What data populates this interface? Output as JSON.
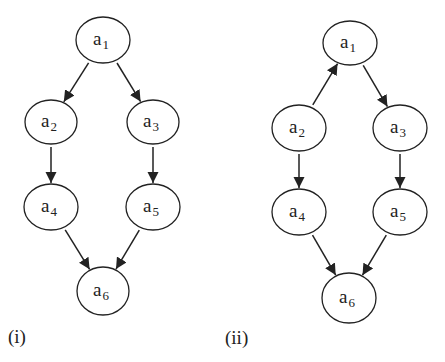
{
  "panels": [
    {
      "id": "i",
      "label": "(i)",
      "label_pos": {
        "x": 8,
        "y": 327
      },
      "nodes": [
        {
          "id": "a1",
          "base": "a",
          "sub": "1",
          "cx": 103,
          "cy": 40,
          "rx": 27,
          "ry": 23
        },
        {
          "id": "a2",
          "base": "a",
          "sub": "2",
          "cx": 51,
          "cy": 122,
          "rx": 26,
          "ry": 22
        },
        {
          "id": "a3",
          "base": "a",
          "sub": "3",
          "cx": 153,
          "cy": 122,
          "rx": 26,
          "ry": 22
        },
        {
          "id": "a4",
          "base": "a",
          "sub": "4",
          "cx": 51,
          "cy": 207,
          "rx": 27,
          "ry": 23
        },
        {
          "id": "a5",
          "base": "a",
          "sub": "5",
          "cx": 153,
          "cy": 207,
          "rx": 27,
          "ry": 23
        },
        {
          "id": "a6",
          "base": "a",
          "sub": "6",
          "cx": 103,
          "cy": 291,
          "rx": 26,
          "ry": 24
        }
      ],
      "edges": [
        {
          "from": "a1",
          "to": "a2"
        },
        {
          "from": "a1",
          "to": "a3"
        },
        {
          "from": "a2",
          "to": "a4"
        },
        {
          "from": "a3",
          "to": "a5"
        },
        {
          "from": "a4",
          "to": "a6"
        },
        {
          "from": "a5",
          "to": "a6"
        }
      ]
    },
    {
      "id": "ii",
      "label": "(ii)",
      "label_pos": {
        "x": 225,
        "y": 328
      },
      "nodes": [
        {
          "id": "a1",
          "base": "a",
          "sub": "1",
          "cx": 350,
          "cy": 43,
          "rx": 27,
          "ry": 22
        },
        {
          "id": "a2",
          "base": "a",
          "sub": "2",
          "cx": 299,
          "cy": 128,
          "rx": 27,
          "ry": 23
        },
        {
          "id": "a3",
          "base": "a",
          "sub": "3",
          "cx": 400,
          "cy": 128,
          "rx": 27,
          "ry": 23
        },
        {
          "id": "a4",
          "base": "a",
          "sub": "4",
          "cx": 299,
          "cy": 212,
          "rx": 27,
          "ry": 23
        },
        {
          "id": "a5",
          "base": "a",
          "sub": "5",
          "cx": 400,
          "cy": 212,
          "rx": 27,
          "ry": 23
        },
        {
          "id": "a6",
          "base": "a",
          "sub": "6",
          "cx": 349,
          "cy": 298,
          "rx": 27,
          "ry": 25
        }
      ],
      "edges": [
        {
          "from": "a2",
          "to": "a1"
        },
        {
          "from": "a1",
          "to": "a3"
        },
        {
          "from": "a2",
          "to": "a4"
        },
        {
          "from": "a3",
          "to": "a5"
        },
        {
          "from": "a4",
          "to": "a6"
        },
        {
          "from": "a5",
          "to": "a6"
        }
      ]
    }
  ],
  "colors": {
    "stroke": "#222222",
    "background": "#ffffff",
    "node_fill": "#ffffff"
  }
}
